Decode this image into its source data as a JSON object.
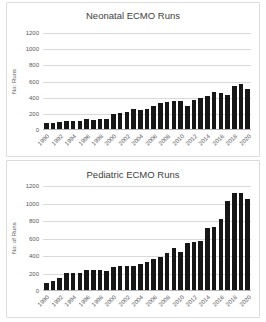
{
  "chart_data": [
    {
      "type": "bar",
      "title": "Neonatal ECMO Runs",
      "ylabel": "No: Runs",
      "ylim": [
        0,
        1200
      ],
      "yticks": [
        0,
        200,
        400,
        600,
        800,
        1000,
        1200
      ],
      "x": [
        1990,
        1991,
        1992,
        1993,
        1994,
        1995,
        1996,
        1997,
        1998,
        1999,
        2000,
        2001,
        2002,
        2003,
        2004,
        2005,
        2006,
        2007,
        2008,
        2009,
        2010,
        2011,
        2012,
        2013,
        2014,
        2015,
        2016,
        2017,
        2018,
        2019,
        2020
      ],
      "values": [
        80,
        80,
        90,
        95,
        95,
        105,
        120,
        115,
        125,
        125,
        185,
        200,
        215,
        245,
        240,
        250,
        285,
        320,
        330,
        350,
        345,
        280,
        360,
        385,
        410,
        455,
        445,
        420,
        530,
        560,
        495
      ],
      "xtick_labels": [
        "1990",
        "1992",
        "1994",
        "1996",
        "1998",
        "2000",
        "2002",
        "2004",
        "2006",
        "2008",
        "2010",
        "2012",
        "2014",
        "2016",
        "2018",
        "2020"
      ],
      "xtick_step": 2,
      "grid": true,
      "legend": "none",
      "bar_color": "#161616",
      "grid_color": "#d9d9d9",
      "axis_color": "#b3b3b3",
      "text_color": "#595959",
      "title_color": "#404040"
    },
    {
      "type": "bar",
      "title": "Pediatric ECMO Runs",
      "ylabel": "No: of Runs",
      "ylim": [
        0,
        1200
      ],
      "yticks": [
        0,
        200,
        400,
        600,
        800,
        1000,
        1200
      ],
      "x": [
        1990,
        1991,
        1992,
        1993,
        1994,
        1995,
        1996,
        1997,
        1998,
        1999,
        2000,
        2001,
        2002,
        2003,
        2004,
        2005,
        2006,
        2007,
        2008,
        2009,
        2010,
        2011,
        2012,
        2013,
        2014,
        2015,
        2016,
        2017,
        2018,
        2019,
        2020
      ],
      "values": [
        80,
        105,
        135,
        195,
        190,
        190,
        230,
        230,
        230,
        220,
        265,
        280,
        275,
        275,
        300,
        320,
        355,
        380,
        420,
        480,
        435,
        535,
        545,
        555,
        710,
        720,
        810,
        1015,
        1105,
        1110,
        1045
      ],
      "xtick_labels": [
        "1990",
        "1992",
        "1994",
        "1996",
        "1998",
        "2000",
        "2002",
        "2004",
        "2006",
        "2008",
        "2010",
        "2012",
        "2014",
        "2016",
        "2018",
        "2020"
      ],
      "xtick_step": 2,
      "grid": true,
      "legend": "none",
      "bar_color": "#161616",
      "grid_color": "#d9d9d9",
      "axis_color": "#b3b3b3",
      "text_color": "#595959",
      "title_color": "#404040"
    }
  ]
}
